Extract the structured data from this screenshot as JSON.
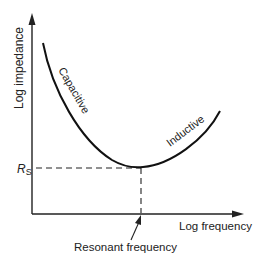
{
  "diagram": {
    "type": "impedance-vs-frequency curve",
    "axes": {
      "y_label": "Log impedance",
      "x_label": "Log frequency"
    },
    "curve_labels": {
      "left_branch": "Capacitive",
      "right_branch": "Inductive"
    },
    "markers": {
      "rs_label_main": "R",
      "rs_label_sub": "S",
      "resonance_label": "Resonant frequency"
    },
    "colors": {
      "ink": "#222222",
      "background": "#ffffff"
    }
  }
}
